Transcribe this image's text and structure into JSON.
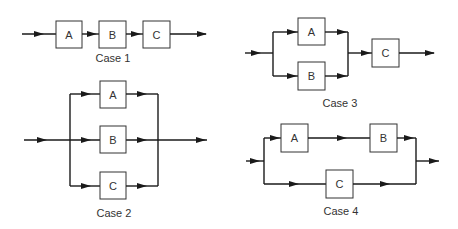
{
  "diagram": {
    "case1": {
      "caption": "Case 1",
      "blocks": [
        "A",
        "B",
        "C"
      ],
      "topology": "series"
    },
    "case2": {
      "caption": "Case 2",
      "blocks": [
        "A",
        "B",
        "C"
      ],
      "topology": "parallel"
    },
    "case3": {
      "caption": "Case 3",
      "blocks": [
        "A",
        "B",
        "C"
      ],
      "topology": "A parallel B, then series C"
    },
    "case4": {
      "caption": "Case 4",
      "blocks": [
        "A",
        "B",
        "C"
      ],
      "topology": "A series B, parallel with C"
    }
  }
}
